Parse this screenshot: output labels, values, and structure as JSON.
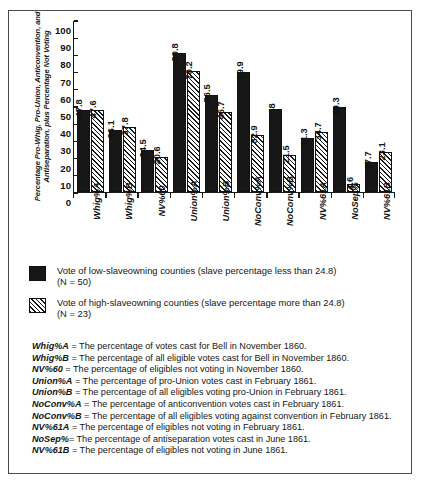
{
  "chart_data": {
    "type": "bar",
    "title": "",
    "xlabel": "",
    "ylabel": "Percentage Pro-Whig, Pro-Union, Anticonvention, and Antiseparation, plus Percentage Not Voting",
    "ylim": [
      0,
      100
    ],
    "yticks": [
      0,
      10,
      20,
      30,
      40,
      50,
      60,
      70,
      80,
      90,
      100
    ],
    "grid": false,
    "legend_position": "below-plot",
    "categories": [
      "Whig%A",
      "Whig%B",
      "NV%60",
      "Union%A",
      "Union%B",
      "NoConv%A",
      "NoConv%B",
      "NV%61A",
      "NoSep%",
      "NV%61B"
    ],
    "series": [
      {
        "name": "Vote of low-slaveowning counties (slave percentage less than 24.8)",
        "n_label": "(N = 50)",
        "fill": "solid-black",
        "color": "#171717",
        "values": [
          47.8,
          36.1,
          24.5,
          80.8,
          56.5,
          69.9,
          48,
          31.3,
          49.3,
          17.7
        ],
        "value_labels": [
          "47.8",
          "36.1",
          "24.5",
          "80.8",
          "56.5",
          "69.9",
          "48",
          "31.3",
          "49.3",
          "17.7"
        ]
      },
      {
        "name": "Vote of high-slaveowning counties (slave percentage more than 24.8)",
        "n_label": "(N = 23)",
        "fill": "diagonal-hatch",
        "color": "#ffffff",
        "values": [
          47.6,
          37.8,
          20.6,
          70.2,
          46.7,
          32.9,
          21.5,
          34.7,
          4.6,
          23.1
        ],
        "value_labels": [
          "47.6",
          "37.8",
          "20.6",
          "70.2",
          "46.7",
          "32.9",
          "21.5",
          "34.7",
          "4.6",
          "23.1"
        ]
      }
    ]
  },
  "legend": {
    "items": [
      {
        "label": "Vote of low-slaveowning counties (slave percentage less than 24.8)",
        "n": "(N = 50)",
        "swatch": "solid"
      },
      {
        "label": "Vote of high-slaveowning counties (slave percentage more than 24.8)",
        "n": "(N = 23)",
        "swatch": "hatch"
      }
    ]
  },
  "footnotes": [
    {
      "key": "Whig%A",
      "text": " = The percentage of votes cast for Bell  in November 1860."
    },
    {
      "key": "Whig%B",
      "text": " = The percentage of all eligible votes cast for Bell  in November 1860."
    },
    {
      "key": "NV%60",
      "text": " = The percentage of eligibles not voting in November 1860."
    },
    {
      "key": "Union%A",
      "text": " = The percentage of  pro-Union votes cast in February 1861."
    },
    {
      "key": "Union%B",
      "text": " = The percentage of all eligibles voting pro-Union in February 1861."
    },
    {
      "key": "NoConv%A",
      "text": " = The percentage of anticonvention votes cast in February 1861."
    },
    {
      "key": "NoConv%B",
      "text": " = The percentage of all eligibles voting against convention in February 1861."
    },
    {
      "key": "NV%61A",
      "text": " = The percentage of eligibles not voting in February 1861."
    },
    {
      "key": "NoSep%",
      "text": "= The percentage of antiseparation votes cast in June 1861."
    },
    {
      "key": "NV%61B",
      "text": " = The percentage of eligibles not voting in June 1861."
    }
  ]
}
